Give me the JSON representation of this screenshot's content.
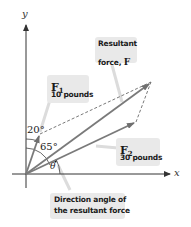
{
  "diagram": {
    "axes": {
      "x_label": "x",
      "y_label": "y"
    },
    "vectors": [
      {
        "id": "F1",
        "name": "F",
        "subscript": "1",
        "magnitude_text": "10 pounds",
        "angle_from_y_axis": "20°"
      },
      {
        "id": "F2",
        "name": "F",
        "subscript": "2",
        "magnitude_text": "30 pounds",
        "angle_from_y_axis": "65°"
      },
      {
        "id": "F",
        "line1": "Resultant",
        "line2_prefix": "force, ",
        "line2_symbol": "F"
      }
    ],
    "angles": {
      "f1_angle": "20°",
      "f2_angle": "65°",
      "theta": "θ"
    },
    "caption": {
      "line1": "Direction angle of",
      "line2": "the resultant force"
    },
    "colors": {
      "vector": "#777777",
      "axis": "#333333",
      "dashed": "#555555",
      "callout_bg": "#e9e9e9",
      "leader": "#d8d8d8"
    }
  }
}
